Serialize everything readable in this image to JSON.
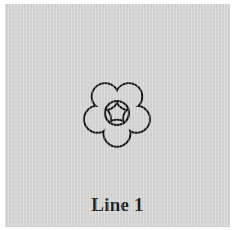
{
  "canvas": {
    "width": 234,
    "height": 230,
    "outer_background_color": "#ffffff",
    "panel_background_color": "#d2d2d2"
  },
  "stimulus": {
    "figure": {
      "icon_name": "flower-outline-icon",
      "description": "five-petal flower outline with circular center",
      "petal_count": 5,
      "stroke_color": "#141414",
      "stroke_width": 2.1,
      "fill": "none",
      "center_circle_radius": 12
    },
    "caption": {
      "text": "Line 1",
      "color": "#1b1b1b"
    }
  }
}
